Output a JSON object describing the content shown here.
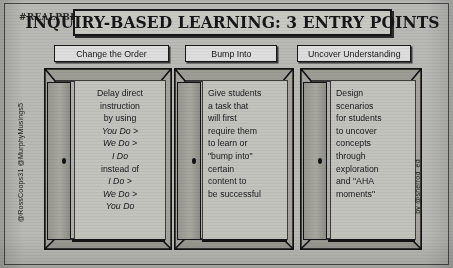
{
  "poster": {
    "hashtag": "#REALPBL",
    "title": "INQUIRY-BASED LEARNING: 3 ENTRY POINTS",
    "credit_left": "@RossCoops31  @MurphyMusings5",
    "credit_right": "by @sherrod_ed"
  },
  "columns": [
    {
      "header": "Change the Order",
      "lines": [
        {
          "text": "Delay direct",
          "style": "plain"
        },
        {
          "text": "instruction",
          "style": "plain"
        },
        {
          "text": "by using",
          "style": "plain"
        },
        {
          "text": "You Do >",
          "style": "italic"
        },
        {
          "text": "We Do >",
          "style": "italic"
        },
        {
          "text": "I Do",
          "style": "italic"
        },
        {
          "text": "instead of",
          "style": "plain"
        },
        {
          "text": "I Do >",
          "style": "italic"
        },
        {
          "text": "We Do >",
          "style": "italic"
        },
        {
          "text": "You Do",
          "style": "italic"
        }
      ]
    },
    {
      "header": "Bump Into",
      "lines": [
        {
          "text": "Give students",
          "style": "plain"
        },
        {
          "text": "a task that",
          "style": "plain"
        },
        {
          "text": "will first",
          "style": "plain"
        },
        {
          "text": "require them",
          "style": "plain"
        },
        {
          "text": "to learn or",
          "style": "plain"
        },
        {
          "text": "\"bump into\"",
          "style": "plain"
        },
        {
          "text": "certain",
          "style": "plain"
        },
        {
          "text": "content to",
          "style": "plain"
        },
        {
          "text": "be successful",
          "style": "plain"
        }
      ]
    },
    {
      "header": "Uncover Understanding",
      "lines": [
        {
          "text": "Design",
          "style": "plain"
        },
        {
          "text": "scenarios",
          "style": "plain"
        },
        {
          "text": "for students",
          "style": "plain"
        },
        {
          "text": "to uncover",
          "style": "plain"
        },
        {
          "text": "concepts",
          "style": "plain"
        },
        {
          "text": "through",
          "style": "plain"
        },
        {
          "text": "exploration",
          "style": "plain"
        },
        {
          "text": "and \"AHA",
          "style": "plain"
        },
        {
          "text": "moments\"",
          "style": "plain"
        }
      ]
    }
  ],
  "colors": {
    "background": "#b4b4b0",
    "ink": "#17171a",
    "panel": "#c3c3be",
    "header_box": "#dedede"
  },
  "icons": {
    "door": "door-icon",
    "knob": "doorknob-icon"
  }
}
